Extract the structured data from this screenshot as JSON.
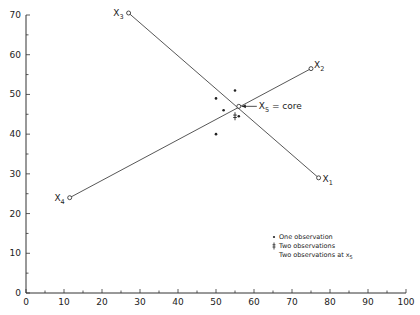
{
  "chart_data": {
    "type": "scatter",
    "title": "",
    "xlabel": "",
    "ylabel": "",
    "xlim": [
      0,
      100
    ],
    "ylim": [
      0,
      70
    ],
    "grid": false,
    "x_ticks": [
      0,
      10,
      20,
      30,
      40,
      50,
      60,
      70,
      80,
      90,
      100
    ],
    "y_ticks": [
      0,
      10,
      20,
      30,
      40,
      50,
      60,
      70
    ],
    "labeled_points": [
      {
        "name": "x1",
        "label": "X",
        "sub": "1",
        "x": 77,
        "y": 29
      },
      {
        "name": "x2",
        "label": "X",
        "sub": "2",
        "x": 75,
        "y": 56.5
      },
      {
        "name": "x3",
        "label": "X",
        "sub": "3",
        "x": 27,
        "y": 70.5
      },
      {
        "name": "x4",
        "label": "X",
        "sub": "4",
        "x": 11.5,
        "y": 24
      },
      {
        "name": "x5",
        "label": "X",
        "sub": "5",
        "x": 56,
        "y": 47
      }
    ],
    "lines": [
      {
        "from": "x3",
        "to": "x1"
      },
      {
        "from": "x4",
        "to": "x2"
      }
    ],
    "one_observation_points": [
      {
        "x": 50,
        "y": 49
      },
      {
        "x": 55,
        "y": 51
      },
      {
        "x": 52,
        "y": 46
      },
      {
        "x": 56,
        "y": 44.5
      },
      {
        "x": 50,
        "y": 40
      }
    ],
    "two_observation_points": [
      {
        "x": 55,
        "y": 44.5
      }
    ],
    "annotation": {
      "text_main": "X",
      "text_sub": "5",
      "text_rest": " = core",
      "points_to": "x5"
    },
    "legend": {
      "position": "lower right",
      "entries": [
        {
          "marker": "•",
          "label": "One observation"
        },
        {
          "marker": "‡",
          "label": "Two observations"
        },
        {
          "marker": "",
          "label": "Two observations at x",
          "sub": "5"
        }
      ]
    }
  }
}
